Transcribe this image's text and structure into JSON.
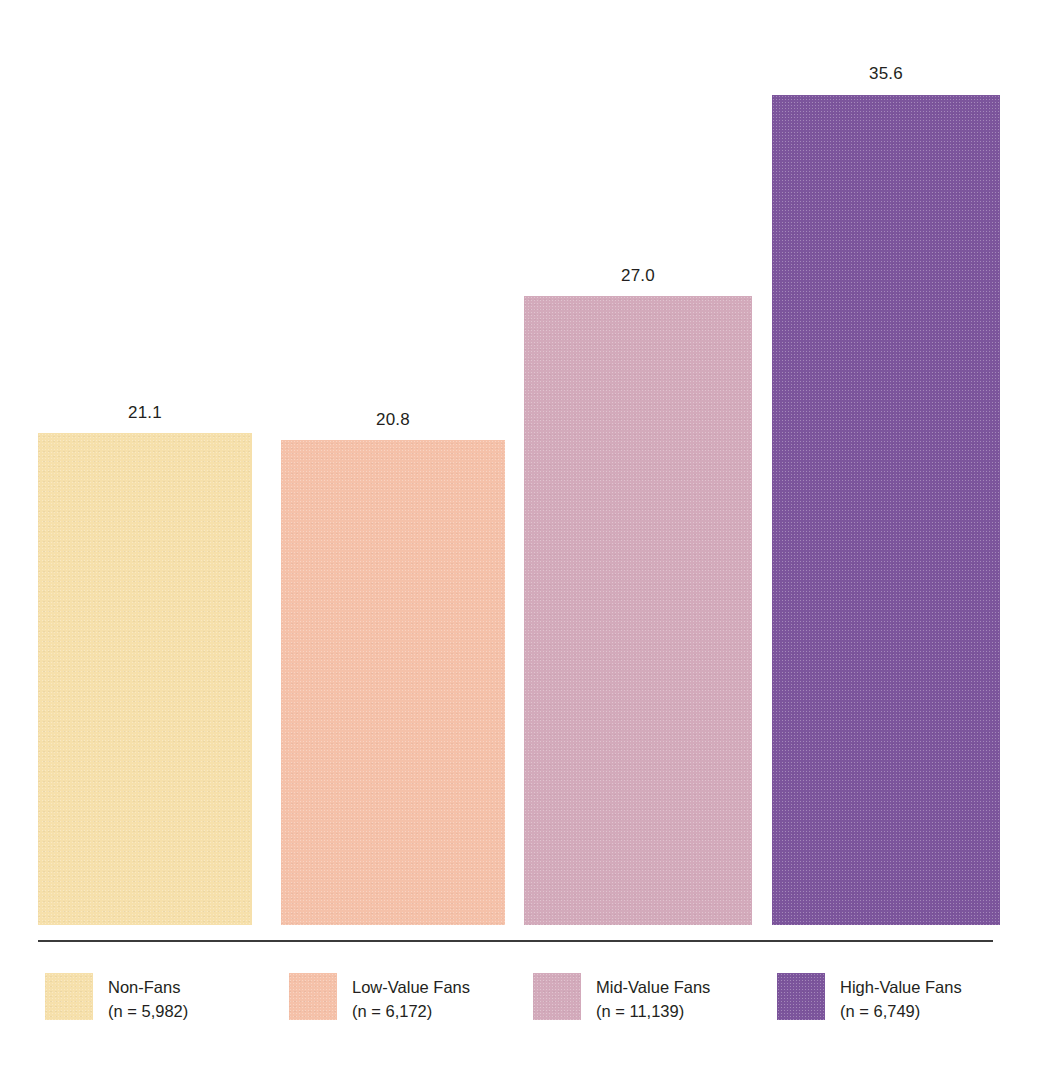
{
  "chart_data": {
    "type": "bar",
    "title": "",
    "subtitle": "",
    "xlabel": "",
    "ylabel": "",
    "ylim": [
      0,
      35.6
    ],
    "grid": false,
    "legend_position": "bottom",
    "categories": [
      "Non-Fans",
      "Low-Value Fans",
      "Mid-Value Fans",
      "High-Value Fans"
    ],
    "values": [
      21.1,
      20.8,
      27.0,
      35.6
    ],
    "value_labels": [
      "21.1",
      "20.8",
      "27.0",
      "35.6"
    ],
    "sample_sizes": [
      "(n = 5,982)",
      "(n = 6,172)",
      "(n = 11,139)",
      "(n = 6,749)"
    ],
    "colors": [
      "#F6E0AB",
      "#F5C1A9",
      "#D3AABB",
      "#7C559C"
    ],
    "series": [
      {
        "name": "",
        "values": [
          21.1,
          20.8,
          27.0,
          35.6
        ]
      }
    ],
    "points": [
      {
        "category": "Non-Fans",
        "value": 21.1,
        "label": "21.1",
        "count": "(n = 5,982)",
        "color": "#F6E0AB"
      },
      {
        "category": "Low-Value Fans",
        "value": 20.8,
        "label": "20.8",
        "count": "(n = 6,172)",
        "color": "#F5C1A9"
      },
      {
        "category": "Mid-Value Fans",
        "value": 27.0,
        "label": "27.0",
        "count": "(n = 11,139)",
        "color": "#D3AABB"
      },
      {
        "category": "High-Value Fans",
        "value": 35.6,
        "label": "35.6",
        "count": "(n = 6,749)",
        "color": "#7C559C"
      }
    ]
  },
  "bars": [
    {
      "value_label": "21.1"
    },
    {
      "value_label": "20.8"
    },
    {
      "value_label": "27.0"
    },
    {
      "value_label": "35.6"
    }
  ],
  "legend": {
    "items": [
      {
        "label": "Non-Fans",
        "count": "(n = 5,982)"
      },
      {
        "label": "Low-Value Fans",
        "count": "(n = 6,172)"
      },
      {
        "label": "Mid-Value Fans",
        "count": "(n = 11,139)"
      },
      {
        "label": "High-Value Fans",
        "count": "(n = 6,749)"
      }
    ]
  },
  "axis": {
    "baseline_color": "#3b3b3b"
  }
}
